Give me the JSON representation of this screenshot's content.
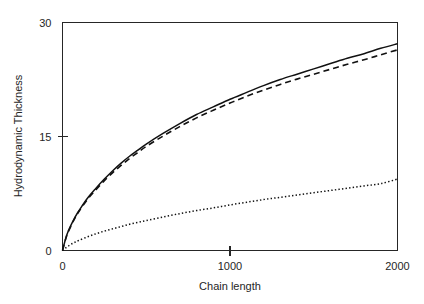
{
  "chart_data": {
    "type": "line",
    "title": "",
    "xlabel": "Chain length",
    "ylabel": "Hydrodynamic Thickness",
    "xlim": [
      0,
      2000
    ],
    "ylim": [
      0,
      30
    ],
    "xticks": [
      0,
      1000,
      2000
    ],
    "xtick_labels": [
      "0",
      "1000",
      "2000"
    ],
    "yticks": [
      0,
      15,
      30
    ],
    "ytick_labels": [
      "0",
      "15",
      "30"
    ],
    "grid": false,
    "legend": "none",
    "background": "#ffffff",
    "axis_color": "#262626",
    "x": [
      0,
      25,
      50,
      75,
      100,
      150,
      200,
      250,
      300,
      350,
      400,
      450,
      500,
      600,
      700,
      800,
      900,
      1000,
      1100,
      1200,
      1300,
      1400,
      1500,
      1600,
      1700,
      1800,
      1900,
      2000
    ],
    "series": [
      {
        "name": "solid-curve",
        "style": "solid",
        "color": "#111111",
        "values": [
          0.0,
          2.0,
          3.3,
          4.4,
          5.3,
          6.9,
          8.2,
          9.4,
          10.5,
          11.5,
          12.4,
          13.2,
          14.0,
          15.4,
          16.7,
          17.9,
          18.9,
          19.9,
          20.8,
          21.7,
          22.5,
          23.2,
          23.9,
          24.6,
          25.3,
          25.9,
          26.6,
          27.2
        ]
      },
      {
        "name": "dashed-curve",
        "style": "dashed",
        "color": "#111111",
        "values": [
          0.0,
          1.95,
          3.2,
          4.3,
          5.2,
          6.75,
          8.0,
          9.2,
          10.25,
          11.2,
          12.1,
          12.9,
          13.7,
          15.05,
          16.3,
          17.45,
          18.45,
          19.4,
          20.3,
          21.1,
          21.85,
          22.55,
          23.2,
          23.85,
          24.5,
          25.1,
          25.75,
          26.4
        ]
      },
      {
        "name": "dotted-curve",
        "style": "dotted",
        "color": "#111111",
        "values": [
          0.0,
          0.45,
          0.8,
          1.1,
          1.35,
          1.8,
          2.2,
          2.55,
          2.85,
          3.15,
          3.45,
          3.7,
          3.95,
          4.4,
          4.85,
          5.25,
          5.6,
          6.0,
          6.35,
          6.7,
          7.0,
          7.3,
          7.6,
          7.9,
          8.2,
          8.5,
          8.8,
          9.4
        ]
      }
    ]
  }
}
